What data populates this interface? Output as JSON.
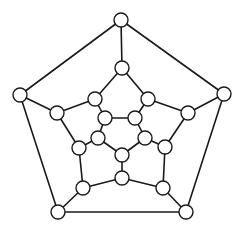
{
  "diagram": {
    "type": "graph",
    "style": {
      "edge_color": "#1a1a1a",
      "node_fill": "#ffffff",
      "node_stroke": "#1a1a1a",
      "background": "#ffffff",
      "node_radius": 7
    },
    "nodes": [
      {
        "id": "O0",
        "x": 121,
        "y": 20
      },
      {
        "id": "O1",
        "x": 224,
        "y": 94
      },
      {
        "id": "O2",
        "x": 186,
        "y": 212
      },
      {
        "id": "O3",
        "x": 58,
        "y": 212
      },
      {
        "id": "O4",
        "x": 20,
        "y": 95
      },
      {
        "id": "M0",
        "x": 122,
        "y": 68
      },
      {
        "id": "M1",
        "x": 148,
        "y": 99
      },
      {
        "id": "M2",
        "x": 188,
        "y": 113
      },
      {
        "id": "M3",
        "x": 165,
        "y": 147
      },
      {
        "id": "M4",
        "x": 163,
        "y": 188
      },
      {
        "id": "M5",
        "x": 122,
        "y": 178
      },
      {
        "id": "M6",
        "x": 83,
        "y": 188
      },
      {
        "id": "M7",
        "x": 79,
        "y": 148
      },
      {
        "id": "M8",
        "x": 57,
        "y": 113
      },
      {
        "id": "M9",
        "x": 95,
        "y": 99
      },
      {
        "id": "I0",
        "x": 105,
        "y": 118
      },
      {
        "id": "I1",
        "x": 135,
        "y": 118
      },
      {
        "id": "I2",
        "x": 145,
        "y": 138
      },
      {
        "id": "I3",
        "x": 122,
        "y": 155
      },
      {
        "id": "I4",
        "x": 98,
        "y": 138
      }
    ],
    "edges": [
      [
        "O0",
        "O1"
      ],
      [
        "O1",
        "O2"
      ],
      [
        "O2",
        "O3"
      ],
      [
        "O3",
        "O4"
      ],
      [
        "O4",
        "O0"
      ],
      [
        "O0",
        "M0"
      ],
      [
        "O1",
        "M2"
      ],
      [
        "O2",
        "M4"
      ],
      [
        "O3",
        "M6"
      ],
      [
        "O4",
        "M8"
      ],
      [
        "M0",
        "M1"
      ],
      [
        "M1",
        "M2"
      ],
      [
        "M2",
        "M3"
      ],
      [
        "M3",
        "M4"
      ],
      [
        "M4",
        "M5"
      ],
      [
        "M5",
        "M6"
      ],
      [
        "M6",
        "M7"
      ],
      [
        "M7",
        "M8"
      ],
      [
        "M8",
        "M9"
      ],
      [
        "M9",
        "M0"
      ],
      [
        "M1",
        "I1"
      ],
      [
        "M3",
        "I2"
      ],
      [
        "M5",
        "I3"
      ],
      [
        "M7",
        "I4"
      ],
      [
        "M9",
        "I0"
      ],
      [
        "I0",
        "I1"
      ],
      [
        "I1",
        "I2"
      ],
      [
        "I2",
        "I3"
      ],
      [
        "I3",
        "I4"
      ],
      [
        "I4",
        "I0"
      ]
    ]
  }
}
